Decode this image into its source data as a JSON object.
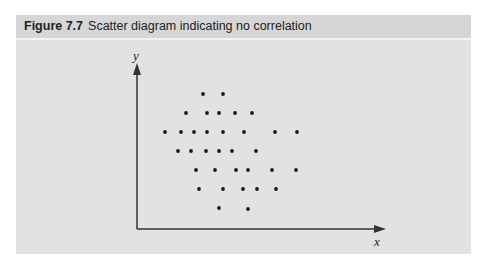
{
  "figure": {
    "number": "Figure 7.7",
    "caption": "Scatter diagram indicating no correlation"
  },
  "axes": {
    "x_label": "x",
    "y_label": "y",
    "color": "#333333"
  },
  "colors": {
    "panel_bg": "#e2e2e2",
    "header_bg": "#d6d6d6",
    "point": "#1a1a1a"
  },
  "chart_data": {
    "type": "scatter",
    "title": "Scatter diagram indicating no correlation",
    "xlabel": "x",
    "ylabel": "y",
    "grid": false,
    "legend": null,
    "note": "Points are in pixel coordinates (screen space); no numeric ticks shown. Pattern shows no correlation.",
    "points": [
      [
        203,
        94
      ],
      [
        223,
        94
      ],
      [
        186,
        113
      ],
      [
        207,
        113
      ],
      [
        219,
        113
      ],
      [
        235,
        113
      ],
      [
        252,
        113
      ],
      [
        165,
        132
      ],
      [
        181,
        132
      ],
      [
        194,
        132
      ],
      [
        207,
        132
      ],
      [
        223,
        132
      ],
      [
        244,
        132
      ],
      [
        275,
        132
      ],
      [
        297,
        132
      ],
      [
        178,
        151
      ],
      [
        191,
        151
      ],
      [
        206,
        151
      ],
      [
        219,
        151
      ],
      [
        232,
        151
      ],
      [
        256,
        151
      ],
      [
        196,
        170
      ],
      [
        215,
        170
      ],
      [
        236,
        170
      ],
      [
        248,
        170
      ],
      [
        272,
        170
      ],
      [
        296,
        170
      ],
      [
        199,
        189
      ],
      [
        223,
        189
      ],
      [
        243,
        189
      ],
      [
        257,
        189
      ],
      [
        276,
        189
      ],
      [
        219,
        208
      ],
      [
        248,
        209
      ]
    ]
  }
}
